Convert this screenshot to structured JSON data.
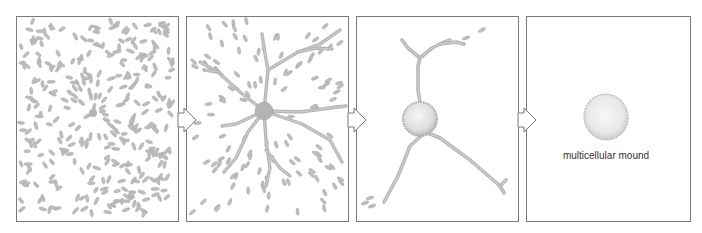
{
  "diagram": {
    "colors": {
      "background": "#ffffff",
      "panel_border": "#7a7a7a",
      "cell_fill": "#bdbdbd",
      "cell_stroke": "#a8a8a8",
      "stream_fill": "#b4b4b4",
      "mound_fill": "#e9e9e9",
      "mound_edge": "#b8b8b8",
      "label_text": "#333333"
    },
    "panels": [
      {
        "id": 1,
        "stage": "scattered cells",
        "x": 16,
        "y": 16,
        "w": 162,
        "h": 205,
        "center": [
          93,
          113
        ]
      },
      {
        "id": 2,
        "stage": "streaming toward center",
        "x": 186,
        "y": 16,
        "w": 162,
        "h": 205,
        "center": [
          264,
          111
        ]
      },
      {
        "id": 3,
        "stage": "aggregate with streams",
        "x": 356,
        "y": 16,
        "w": 162,
        "h": 205,
        "center": [
          420,
          119
        ]
      },
      {
        "id": 4,
        "stage": "mound",
        "x": 526,
        "y": 16,
        "w": 164,
        "h": 205,
        "center": [
          606,
          117
        ]
      }
    ],
    "arrows": [
      {
        "x": 178,
        "y": 120
      },
      {
        "x": 348,
        "y": 120
      },
      {
        "x": 518,
        "y": 120
      }
    ],
    "labels": {
      "mound": "multicellular mound"
    }
  }
}
